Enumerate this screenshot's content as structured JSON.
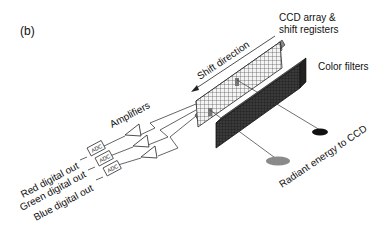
{
  "panel_label": "(b)",
  "labels": {
    "ccd_array_line1": "CCD array &",
    "ccd_array_line2": "shift registers",
    "shift_direction": "Shift direction",
    "color_filters": "Color filters",
    "amplifiers": "Amplifiers",
    "radiant_energy": "Radiant energy to CCD",
    "adc": "ADC"
  },
  "outputs": [
    {
      "label": "Red digital out"
    },
    {
      "label": "Green digital out"
    },
    {
      "label": "Blue digital out"
    }
  ],
  "colors": {
    "ink": "#111111",
    "filter_dark": "#2a2a2a",
    "spot_gray": "#8a8a8a",
    "spot_black": "#111111"
  }
}
